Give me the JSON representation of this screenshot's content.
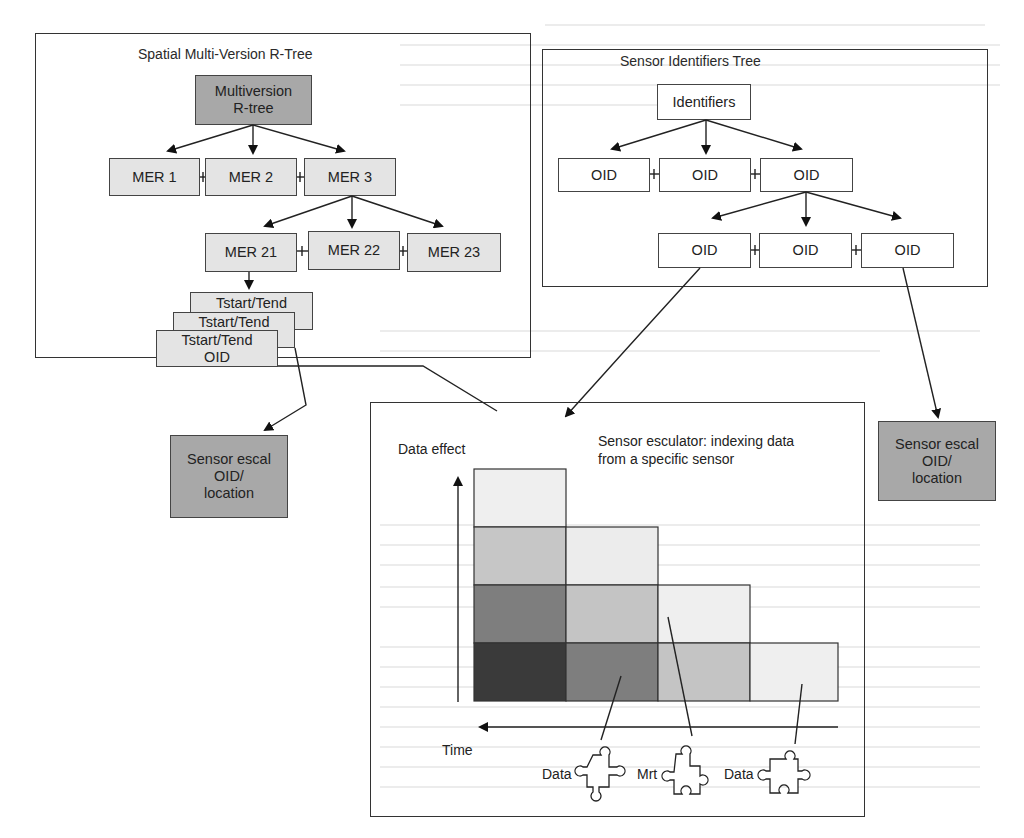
{
  "spatial_tree": {
    "title": "Spatial Multi-Version R-Tree",
    "root": "Multiversion R-tree",
    "root_lines": [
      "Multiversion",
      "R-tree"
    ],
    "level1": [
      "MER 1",
      "MER 2",
      "MER 3"
    ],
    "level2": [
      "MER 21",
      "MER 22",
      "MER 23"
    ],
    "records": [
      {
        "lines": [
          "Tstart/Tend"
        ]
      },
      {
        "lines": [
          "Tstart/Tend"
        ]
      },
      {
        "lines": [
          "Tstart/Tend",
          "OID"
        ]
      }
    ]
  },
  "identifiers_tree": {
    "title": "Sensor Identifiers Tree",
    "root": "Identifiers",
    "level1": [
      "OID",
      "OID",
      "OID"
    ],
    "level2": [
      "OID",
      "OID",
      "OID"
    ]
  },
  "sensor_boxes": [
    {
      "lines": [
        "Sensor escal",
        "OID/",
        "location"
      ]
    },
    {
      "lines": [
        "Sensor escal",
        "OID/",
        "location"
      ]
    }
  ],
  "escalator": {
    "title_lines": [
      "Sensor esculator: indexing data",
      "from a specific sensor"
    ],
    "y_axis_label": "Data effect",
    "x_axis_label": "Time",
    "pieces": [
      "Data",
      "Mrt",
      "Data"
    ],
    "grid_colors": {
      "darkest": "#3a3a3a",
      "dark": "#7e7e7e",
      "mid": "#c4c4c4",
      "light": "#e2e2e2",
      "lightest": "#efefef"
    }
  }
}
